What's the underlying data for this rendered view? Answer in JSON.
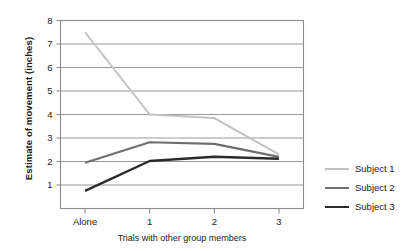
{
  "chart_data": {
    "type": "line",
    "title": "",
    "xlabel": "Trials with other group members",
    "ylabel": "Estimate of movement (inches)",
    "categories": [
      "Alone",
      "1",
      "2",
      "3"
    ],
    "xtick_labels": [
      "Alone",
      "1",
      "2",
      "3"
    ],
    "ytick_labels": [
      "1",
      "2",
      "3",
      "4",
      "5",
      "6",
      "7",
      "8"
    ],
    "yticks": [
      1,
      2,
      3,
      4,
      5,
      6,
      7,
      8
    ],
    "ylim": [
      0,
      8
    ],
    "xlim": [
      -0.38,
      3.38
    ],
    "grid": "horizontal",
    "legend_position": "right",
    "series": [
      {
        "name": "Subject 1",
        "color": "#c2c2c2",
        "width": 2.0,
        "values": [
          7.5,
          4.0,
          3.85,
          2.3
        ]
      },
      {
        "name": "Subject 2",
        "color": "#6e6e6e",
        "width": 2.2,
        "values": [
          1.95,
          2.82,
          2.75,
          2.2
        ]
      },
      {
        "name": "Subject 3",
        "color": "#2b2b2b",
        "width": 2.4,
        "values": [
          0.75,
          2.02,
          2.2,
          2.12
        ]
      }
    ]
  },
  "legend": {
    "items": [
      {
        "label": "Subject 1"
      },
      {
        "label": "Subject 2"
      },
      {
        "label": "Subject 3"
      }
    ]
  },
  "axes": {
    "frame_color": "#8c8c8c",
    "grid_color": "#8c8c8c"
  }
}
